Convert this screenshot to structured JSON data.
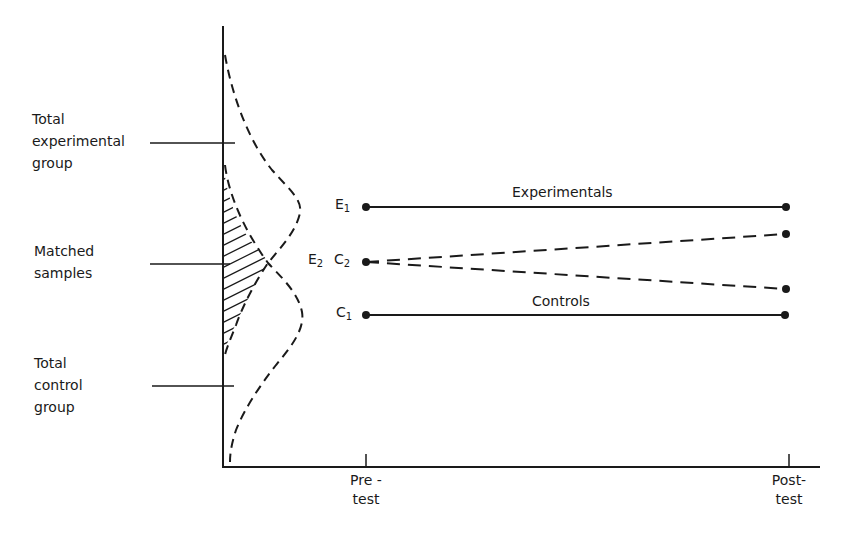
{
  "diagram": {
    "type": "matching-regression-illustration",
    "y_axis_labels": [
      {
        "id": "total-experimental",
        "lines": [
          "Total",
          "experimental",
          "group"
        ],
        "y": 143
      },
      {
        "id": "matched-samples",
        "lines": [
          "Matched",
          "samples"
        ],
        "y": 264
      },
      {
        "id": "total-control",
        "lines": [
          "Total",
          "control",
          "group"
        ],
        "y": 386
      }
    ],
    "x_axis_ticks": [
      {
        "id": "pretest",
        "lines": [
          "Pre -",
          "test"
        ],
        "x": 366
      },
      {
        "id": "posttest",
        "lines": [
          "Post-",
          "test"
        ],
        "x": 789
      }
    ],
    "series": [
      {
        "id": "experimentals",
        "label": "Experimentals",
        "style": "solid",
        "start_label": "E",
        "start_sub": "1",
        "pre_y": 207,
        "post_y": 207
      },
      {
        "id": "e2-matched",
        "label": "",
        "style": "dashed",
        "start_label": "E",
        "start_sub": "2",
        "pre_y": 262,
        "post_y": 234
      },
      {
        "id": "c2-matched",
        "label": "",
        "style": "dashed",
        "start_label": "C",
        "start_sub": "2",
        "pre_y": 262,
        "post_y": 289
      },
      {
        "id": "controls",
        "label": "Controls",
        "style": "solid",
        "start_label": "C",
        "start_sub": "1",
        "pre_y": 315,
        "post_y": 315
      }
    ],
    "distributions": [
      {
        "id": "experimental-distribution",
        "style": "dashed",
        "peak_y": 207
      },
      {
        "id": "control-distribution",
        "style": "dashed",
        "peak_y": 315
      }
    ],
    "overlap_region": {
      "id": "matched-overlap",
      "fill": "hatched"
    }
  }
}
